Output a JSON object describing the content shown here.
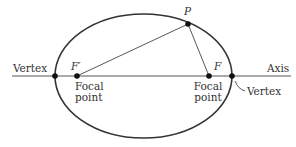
{
  "diagram": {
    "labels": {
      "vertex_left": "Vertex",
      "vertex_right": "Vertex",
      "axis": "Axis",
      "focus_left": "F′",
      "focus_right": "F",
      "point_p": "P",
      "focal_left_line1": "Focal",
      "focal_left_line2": "point",
      "focal_right_line1": "Focal",
      "focal_right_line2": "point"
    },
    "colors": {
      "stroke": "#333333",
      "text": "#333333",
      "background": "#ffffff"
    }
  }
}
